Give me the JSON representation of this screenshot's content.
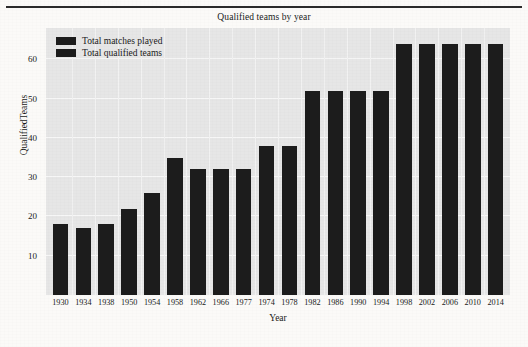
{
  "chart_data": {
    "type": "bar",
    "title": "Qualified teams by year",
    "xlabel": "Year",
    "ylabel": "QualifiedTeams",
    "categories": [
      "1930",
      "1934",
      "1938",
      "1950",
      "1954",
      "1958",
      "1962",
      "1966",
      "1977",
      "1974",
      "1978",
      "1982",
      "1986",
      "1990",
      "1994",
      "1998",
      "2002",
      "2006",
      "2010",
      "2014"
    ],
    "values": [
      18,
      17,
      18,
      22,
      26,
      35,
      32,
      32,
      32,
      38,
      38,
      52,
      52,
      52,
      52,
      64,
      64,
      64,
      64,
      64
    ],
    "ylim": [
      0,
      68
    ],
    "yticks": [
      10,
      20,
      30,
      40,
      50,
      60
    ],
    "ytick_labels": [
      "10",
      "20",
      "30",
      "40",
      "50",
      "60"
    ],
    "grid": true,
    "legend_position": "upper left",
    "legend": [
      {
        "label": "Total matches played",
        "color": "#1c1c1c"
      },
      {
        "label": "Total qualified teams",
        "color": "#1c1c1c"
      }
    ],
    "series": [
      {
        "name": "Total qualified teams",
        "values": [
          18,
          17,
          18,
          22,
          26,
          35,
          32,
          32,
          32,
          38,
          38,
          52,
          52,
          52,
          52,
          64,
          64,
          64,
          64,
          64
        ]
      }
    ],
    "colors": {
      "bar": "#1c1c1c",
      "panel_background": "#e6e6e6",
      "gridline": "#f7f7f7",
      "page_background": "#fbfaf8",
      "text": "#1a1a1a"
    }
  }
}
